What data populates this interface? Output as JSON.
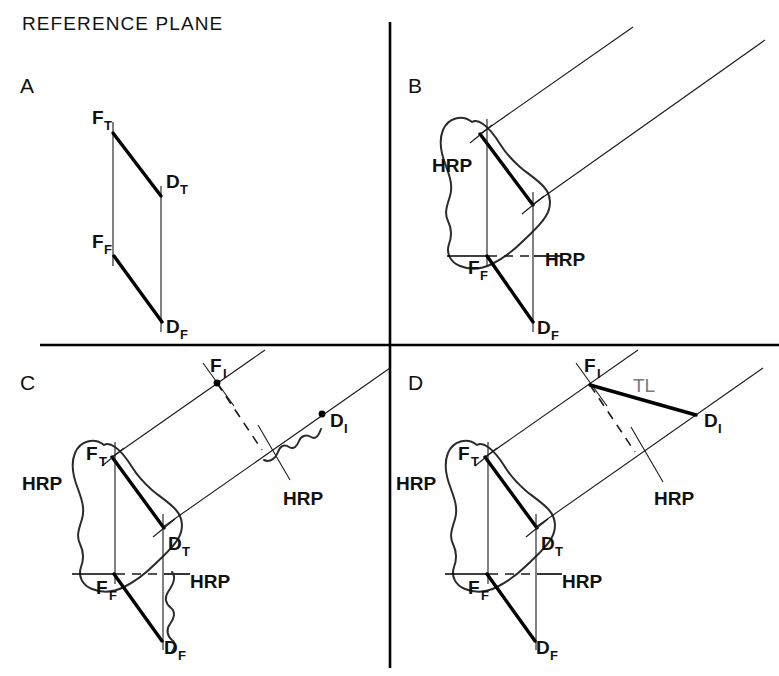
{
  "figure": {
    "title": "REFERENCE PLANE",
    "background_color": "#ffffff",
    "line_color": "#000000",
    "accent_color": "#7a7a7a",
    "width": 779,
    "height": 676
  },
  "panels": [
    {
      "id": "A",
      "label": "A",
      "description": "Front and top views of a line FD shown as a parallelogram between two projection planes",
      "labels": [
        {
          "text": "F",
          "sub": "T",
          "x": 92,
          "y": 124
        },
        {
          "text": "D",
          "sub": "T",
          "x": 166,
          "y": 188
        },
        {
          "text": "F",
          "sub": "F",
          "x": 92,
          "y": 248
        },
        {
          "text": "D",
          "sub": "F",
          "x": 166,
          "y": 333
        }
      ]
    },
    {
      "id": "B",
      "label": "B",
      "description": "Bone (femur) outline with top view line FT-DT and front view FF-DF, horizontal reference plane HRP",
      "labels": [
        {
          "text": "HRP",
          "x": 432,
          "y": 172
        },
        {
          "text": "F",
          "sub": "F",
          "x": 468,
          "y": 272
        },
        {
          "text": "HRP",
          "x": 545,
          "y": 266
        },
        {
          "text": "D",
          "sub": "F",
          "x": 537,
          "y": 333
        }
      ]
    },
    {
      "id": "C",
      "label": "C",
      "description": "Auxiliary inclined view construction: points FI and DI located on projection rays with HRP reference lines and break symbols",
      "labels": [
        {
          "text": "F",
          "sub": "I",
          "x": 210,
          "y": 368
        },
        {
          "text": "D",
          "sub": "I",
          "x": 328,
          "y": 425
        },
        {
          "text": "HRP",
          "x": 283,
          "y": 505
        },
        {
          "text": "F",
          "sub": "T",
          "x": 86,
          "y": 450
        },
        {
          "text": "D",
          "sub": "T",
          "x": 165,
          "y": 548
        },
        {
          "text": "HRP",
          "x": 30,
          "y": 490
        },
        {
          "text": "F",
          "sub": "F",
          "x": 96,
          "y": 592
        },
        {
          "text": "HRP",
          "x": 188,
          "y": 588
        },
        {
          "text": "D",
          "sub": "F",
          "x": 164,
          "y": 652
        }
      ]
    },
    {
      "id": "D",
      "label": "D",
      "description": "Completed auxiliary view showing the true length TL of the line from FI to DI",
      "labels": [
        {
          "text": "F",
          "sub": "I",
          "x": 584,
          "y": 368
        },
        {
          "text": "TL",
          "x": 633,
          "y": 392
        },
        {
          "text": "D",
          "sub": "I",
          "x": 704,
          "y": 425
        },
        {
          "text": "HRP",
          "x": 654,
          "y": 505
        },
        {
          "text": "F",
          "sub": "T",
          "x": 458,
          "y": 450
        },
        {
          "text": "D",
          "sub": "T",
          "x": 537,
          "y": 548
        },
        {
          "text": "HRP",
          "x": 404,
          "y": 490
        },
        {
          "text": "F",
          "sub": "F",
          "x": 468,
          "y": 592
        },
        {
          "text": "HRP",
          "x": 560,
          "y": 588
        },
        {
          "text": "D",
          "sub": "F",
          "x": 536,
          "y": 652
        }
      ]
    }
  ],
  "legend_terms": {
    "FT": "front-view top point",
    "DT": "distal top point",
    "FF": "front-view front point",
    "DF": "distal front point",
    "FI": "inclined view F point",
    "DI": "inclined view D point",
    "HRP": "horizontal reference plane",
    "TL": "true length"
  }
}
